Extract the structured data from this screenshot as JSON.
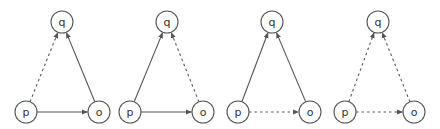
{
  "diagrams": [
    {
      "id": "d1",
      "nodes": {
        "p": {
          "label": "p",
          "x": 26,
          "y": 112
        },
        "o": {
          "label": "o",
          "x": 99,
          "y": 112
        },
        "q": {
          "label": "q",
          "x": 62,
          "y": 22
        }
      },
      "edges": [
        {
          "from": "p",
          "to": "q",
          "style": "dashed"
        },
        {
          "from": "p",
          "to": "o",
          "style": "solid"
        },
        {
          "from": "o",
          "to": "q",
          "style": "solid"
        }
      ]
    },
    {
      "id": "d2",
      "nodes": {
        "p": {
          "label": "p",
          "x": 130,
          "y": 112
        },
        "o": {
          "label": "o",
          "x": 203,
          "y": 112
        },
        "q": {
          "label": "q",
          "x": 167,
          "y": 22
        }
      },
      "edges": [
        {
          "from": "p",
          "to": "q",
          "style": "solid"
        },
        {
          "from": "p",
          "to": "o",
          "style": "solid"
        },
        {
          "from": "o",
          "to": "q",
          "style": "dashed"
        }
      ]
    },
    {
      "id": "d3",
      "nodes": {
        "p": {
          "label": "p",
          "x": 238,
          "y": 112
        },
        "o": {
          "label": "o",
          "x": 310,
          "y": 112
        },
        "q": {
          "label": "q",
          "x": 272,
          "y": 22
        }
      },
      "edges": [
        {
          "from": "p",
          "to": "q",
          "style": "solid"
        },
        {
          "from": "p",
          "to": "o",
          "style": "dashed"
        },
        {
          "from": "o",
          "to": "q",
          "style": "solid"
        }
      ]
    },
    {
      "id": "d4",
      "nodes": {
        "p": {
          "label": "p",
          "x": 345,
          "y": 112
        },
        "o": {
          "label": "o",
          "x": 414,
          "y": 112
        },
        "q": {
          "label": "q",
          "x": 378,
          "y": 22
        }
      },
      "edges": [
        {
          "from": "p",
          "to": "q",
          "style": "dashed"
        },
        {
          "from": "p",
          "to": "o",
          "style": "dashed"
        },
        {
          "from": "o",
          "to": "q",
          "style": "dashed"
        }
      ]
    }
  ],
  "style": {
    "node_radius": 11,
    "stroke_color": "#555555",
    "background": "#ffffff"
  }
}
